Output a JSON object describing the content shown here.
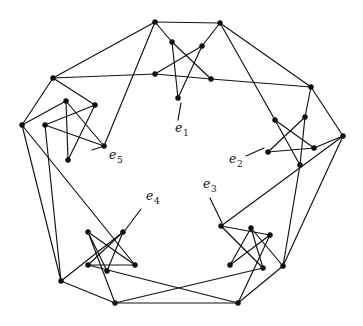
{
  "figure": {
    "type": "graph-diagram",
    "background_color": "#ffffff",
    "ink_color": "#121212",
    "width": 363,
    "height": 326
  },
  "labels": [
    {
      "id": "e1",
      "base": "e",
      "sub": "1",
      "text": "e1",
      "x": 175,
      "y": 132,
      "leader": [
        [
          181,
          103
        ],
        [
          178,
          120
        ]
      ]
    },
    {
      "id": "e2",
      "base": "e",
      "sub": "2",
      "text": "e2",
      "x": 229,
      "y": 163,
      "leader": [
        [
          264,
          148
        ],
        [
          246,
          156
        ]
      ]
    },
    {
      "id": "e3",
      "base": "e",
      "sub": "3",
      "text": "e3",
      "x": 203,
      "y": 188,
      "leader": [
        [
          222,
          223
        ],
        [
          210,
          198
        ]
      ]
    },
    {
      "id": "e4",
      "base": "e",
      "sub": "4",
      "text": "e4",
      "x": 146,
      "y": 200,
      "leader": [
        [
          123,
          233
        ],
        [
          141,
          209
        ]
      ]
    },
    {
      "id": "e5",
      "base": "e",
      "sub": "5",
      "text": "e5",
      "x": 109,
      "y": 159,
      "leader": [
        [
          104,
          146
        ],
        [
          92,
          150
        ]
      ]
    }
  ],
  "outer_ring": {
    "description": "Outer decagon formed by two boundary vertices per gadget side",
    "vertices": [
      {
        "id": "o1",
        "x": 155,
        "y": 22
      },
      {
        "id": "o2",
        "x": 220,
        "y": 23
      },
      {
        "id": "o3",
        "x": 311,
        "y": 87
      },
      {
        "id": "o4",
        "x": 343,
        "y": 136
      },
      {
        "id": "o5",
        "x": 283,
        "y": 266
      },
      {
        "id": "o6",
        "x": 238,
        "y": 303
      },
      {
        "id": "o7",
        "x": 115,
        "y": 303
      },
      {
        "id": "o8",
        "x": 61,
        "y": 281
      },
      {
        "id": "o9",
        "x": 22,
        "y": 125
      },
      {
        "id": "o10",
        "x": 53,
        "y": 78
      }
    ]
  },
  "gadgets": [
    {
      "id": "g1",
      "near_label": "e1",
      "star_nodes": [
        {
          "x": 172,
          "y": 42
        },
        {
          "x": 202,
          "y": 46
        },
        {
          "x": 211,
          "y": 79
        },
        {
          "x": 178,
          "y": 98
        },
        {
          "x": 155,
          "y": 74
        }
      ]
    },
    {
      "id": "g2",
      "near_label": "e2",
      "star_nodes": [
        {
          "x": 305,
          "y": 117
        },
        {
          "x": 314,
          "y": 148
        },
        {
          "x": 300,
          "y": 165
        },
        {
          "x": 268,
          "y": 152
        },
        {
          "x": 275,
          "y": 120
        }
      ]
    },
    {
      "id": "g3",
      "near_label": "e3",
      "star_nodes": [
        {
          "x": 251,
          "y": 228
        },
        {
          "x": 270,
          "y": 235
        },
        {
          "x": 263,
          "y": 268
        },
        {
          "x": 230,
          "y": 265
        },
        {
          "x": 221,
          "y": 226
        }
      ]
    },
    {
      "id": "g4",
      "near_label": "e4",
      "star_nodes": [
        {
          "x": 88,
          "y": 232
        },
        {
          "x": 123,
          "y": 232
        },
        {
          "x": 135,
          "y": 265
        },
        {
          "x": 107,
          "y": 271
        },
        {
          "x": 88,
          "y": 265
        }
      ]
    },
    {
      "id": "g5",
      "near_label": "e5",
      "star_nodes": [
        {
          "x": 66,
          "y": 101
        },
        {
          "x": 95,
          "y": 105
        },
        {
          "x": 104,
          "y": 146
        },
        {
          "x": 68,
          "y": 160
        },
        {
          "x": 45,
          "y": 125
        }
      ]
    }
  ]
}
